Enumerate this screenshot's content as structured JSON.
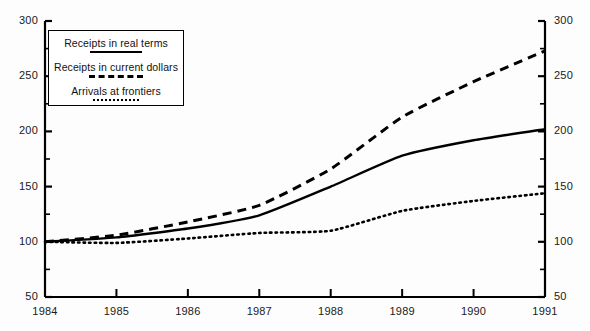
{
  "chart_data": {
    "type": "line",
    "title": "",
    "subtitle": "",
    "xlabel": "",
    "ylabel": "",
    "x": [
      1984,
      1985,
      1986,
      1987,
      1988,
      1989,
      1990,
      1991
    ],
    "xtick_labels": [
      "1984",
      "1985",
      "1986",
      "1987",
      "1988",
      "1989",
      "1990",
      "1991"
    ],
    "xlim": [
      1984,
      1991
    ],
    "ylim": [
      50,
      300
    ],
    "ytick_labels_left": [
      "300",
      "250",
      "200",
      "150",
      "100",
      "50"
    ],
    "ytick_labels_right": [
      "300",
      "250",
      "200",
      "150",
      "100",
      "50"
    ],
    "ytick_values": [
      300,
      250,
      200,
      150,
      100,
      50
    ],
    "yminor_step": 25,
    "grid": false,
    "legend_position": "upper-left-inside",
    "index_base": "1984 = 100",
    "series": [
      {
        "name": "Receipts in real terms",
        "style": "solid",
        "color": "#000000",
        "values": [
          100,
          104,
          112,
          124,
          150,
          178,
          192,
          202
        ]
      },
      {
        "name": "Receipts in current dollars",
        "style": "dashed",
        "color": "#000000",
        "values": [
          100,
          106,
          118,
          133,
          166,
          213,
          245,
          273
        ]
      },
      {
        "name": "Arrivals at frontiers",
        "style": "dotted",
        "color": "#000000",
        "values": [
          100,
          99,
          103,
          108,
          110,
          128,
          137,
          144
        ]
      }
    ]
  },
  "legend": {
    "entries": [
      {
        "label": "Receipts in real terms",
        "style": "solid"
      },
      {
        "label": "Receipts in current dollars",
        "style": "dashed"
      },
      {
        "label": "Arrivals at frontiers",
        "style": "dotted"
      }
    ]
  },
  "axes": {
    "left": {
      "labels": [
        "300",
        "250",
        "200",
        "150",
        "100",
        "50"
      ]
    },
    "right": {
      "labels": [
        "300",
        "250",
        "200",
        "150",
        "100",
        "50"
      ]
    },
    "bottom": {
      "labels": [
        "1984",
        "1985",
        "1986",
        "1987",
        "1988",
        "1989",
        "1990",
        "1991"
      ]
    }
  }
}
